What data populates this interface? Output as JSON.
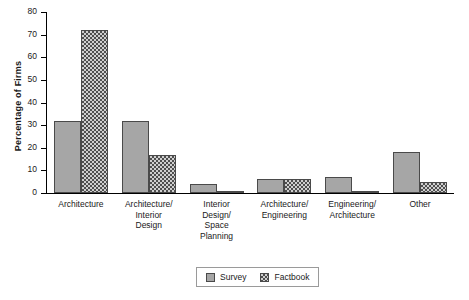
{
  "chart_data": {
    "type": "bar",
    "title": "",
    "xlabel": "",
    "ylabel": "Percentage of Firms",
    "ylim": [
      0,
      80
    ],
    "yticks": [
      0,
      10,
      20,
      30,
      40,
      50,
      60,
      70,
      80
    ],
    "ytick_labels": [
      "0",
      "10",
      "20",
      "30",
      "40",
      "50",
      "60",
      "70",
      "80"
    ],
    "grid": false,
    "legend_position": "bottom",
    "categories": [
      "Architecture",
      "Architecture/\nInterior\nDesign",
      "Interior\nDesign/\nSpace\nPlanning",
      "Architecture/\nEngineering",
      "Engineering/\nArchitecture",
      "Other"
    ],
    "series": [
      {
        "name": "Survey",
        "color": "#a6a6a6",
        "pattern": "solid",
        "values": [
          32,
          32,
          4,
          6,
          7,
          18
        ]
      },
      {
        "name": "Factbook",
        "color": "#4f4f4f",
        "pattern": "crosshatch",
        "values": [
          72,
          17,
          1,
          6,
          1,
          5
        ]
      }
    ]
  },
  "legend": {
    "items": [
      {
        "label": "Survey"
      },
      {
        "label": "Factbook"
      }
    ]
  }
}
